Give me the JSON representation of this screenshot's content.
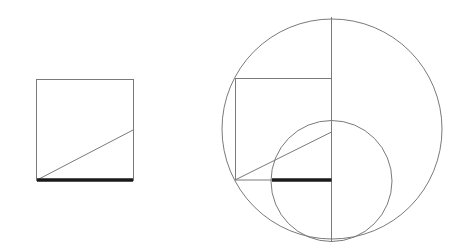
{
  "diagram": {
    "colors": {
      "line": "#7a7a7a",
      "highlight_segment": "#1a1a1a",
      "background": "#ffffff"
    },
    "figures": [
      {
        "name": "left-figure",
        "elements": [
          "square",
          "diagonal-segment",
          "bold-base-segment"
        ]
      },
      {
        "name": "right-figure",
        "elements": [
          "large-circle",
          "small-circle",
          "vertical-axis",
          "square",
          "diagonal-segment",
          "bold-base-segment"
        ]
      }
    ]
  }
}
